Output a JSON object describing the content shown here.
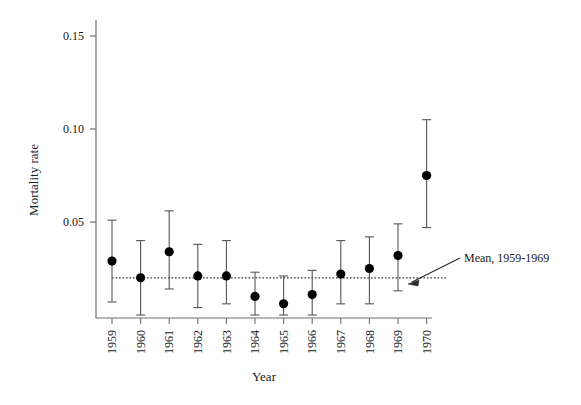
{
  "chart_data": {
    "type": "scatter",
    "title": "",
    "xlabel": "Year",
    "ylabel": "Mortality rate",
    "categories": [
      "1959",
      "1960",
      "1961",
      "1962",
      "1963",
      "1964",
      "1965",
      "1966",
      "1967",
      "1968",
      "1969",
      "1970"
    ],
    "values": [
      0.029,
      0.02,
      0.034,
      0.021,
      0.021,
      0.01,
      0.006,
      0.011,
      0.022,
      0.025,
      0.032,
      0.075
    ],
    "error_low": [
      0.007,
      0.0,
      0.014,
      0.004,
      0.006,
      0.0,
      0.0,
      0.0,
      0.006,
      0.006,
      0.013,
      0.047
    ],
    "error_high": [
      0.051,
      0.04,
      0.056,
      0.038,
      0.04,
      0.023,
      0.021,
      0.024,
      0.04,
      0.042,
      0.049,
      0.105
    ],
    "ylim": [
      0.0,
      0.165
    ],
    "yticks": [
      0.05,
      0.1,
      0.15
    ],
    "ytick_labels": [
      "0.05",
      "0.10",
      "0.15"
    ],
    "grid": false,
    "legend": "none",
    "marker": "filled-circle",
    "marker_color": "#000000",
    "errorbar_color": "#555555",
    "annotations": [
      {
        "text": "Mean, 1959-1969",
        "kind": "arrow-label",
        "points_to": "mean-reference-line"
      }
    ],
    "reference_line": {
      "label": "Mean, 1959-1969",
      "value": 0.02,
      "style": "dotted",
      "color": "#333333",
      "x_start_year": "1959",
      "x_end_year": "1970"
    }
  },
  "axes": {
    "y": {
      "title": "Mortality rate",
      "ticks": [
        {
          "label": "0.15",
          "value": 0.15
        },
        {
          "label": "0.10",
          "value": 0.1
        },
        {
          "label": "0.05",
          "value": 0.05
        }
      ]
    },
    "x": {
      "title": "Year",
      "ticks": [
        {
          "label": "1959"
        },
        {
          "label": "1960"
        },
        {
          "label": "1961"
        },
        {
          "label": "1962"
        },
        {
          "label": "1963"
        },
        {
          "label": "1964"
        },
        {
          "label": "1965"
        },
        {
          "label": "1966"
        },
        {
          "label": "1967"
        },
        {
          "label": "1968"
        },
        {
          "label": "1969"
        },
        {
          "label": "1970"
        }
      ]
    }
  },
  "annotation": {
    "mean_label": "Mean, 1959-1969"
  }
}
